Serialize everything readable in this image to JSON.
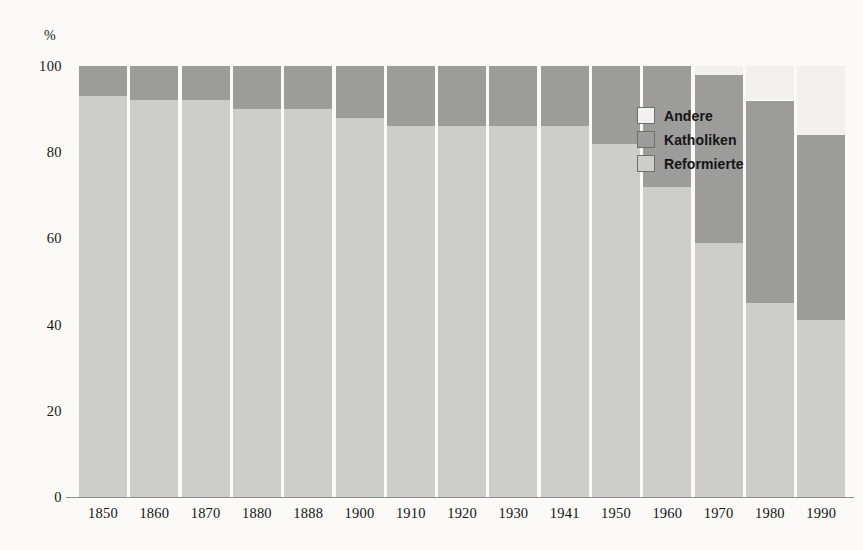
{
  "chart_data": {
    "type": "bar",
    "stacked": true,
    "title": "",
    "subtitle": "",
    "xlabel": "",
    "ylabel": "%",
    "ylim": [
      0,
      100
    ],
    "yticks": [
      "0",
      "20",
      "40",
      "60",
      "80",
      "100"
    ],
    "ytick_values": [
      0,
      20,
      40,
      60,
      80,
      100
    ],
    "grid": false,
    "legend_position": "inside-right",
    "categories": [
      "1850",
      "1860",
      "1870",
      "1880",
      "1888",
      "1900",
      "1910",
      "1920",
      "1930",
      "1941",
      "1950",
      "1960",
      "1970",
      "1980",
      "1990"
    ],
    "series": [
      {
        "name": "Reformierte",
        "color": "#cdcdcb",
        "values": [
          93,
          92,
          92,
          90,
          90,
          88,
          86,
          86,
          86,
          86,
          82,
          72,
          59,
          45,
          41
        ]
      },
      {
        "name": "Katholiken",
        "color": "#9c9c9a",
        "values": [
          7,
          8,
          8,
          10,
          10,
          12,
          14,
          14,
          14,
          14,
          18,
          28,
          39,
          47,
          43
        ]
      },
      {
        "name": "Andere",
        "color": "#f2f1ef",
        "values": [
          0,
          0,
          0,
          0,
          0,
          0,
          0,
          0,
          0,
          0,
          0,
          0,
          2,
          8,
          16
        ]
      }
    ]
  },
  "axis": {
    "unit_label": "%",
    "y_ticks": [
      {
        "label": "100",
        "value": 100
      },
      {
        "label": "80",
        "value": 80
      },
      {
        "label": "60",
        "value": 60
      },
      {
        "label": "40",
        "value": 40
      },
      {
        "label": "20",
        "value": 20
      },
      {
        "label": "0",
        "value": 0
      }
    ],
    "x_ticks": [
      "1850",
      "1860",
      "1870",
      "1880",
      "1888",
      "1900",
      "1910",
      "1920",
      "1930",
      "1941",
      "1950",
      "1960",
      "1970",
      "1980",
      "1990"
    ]
  },
  "legend": {
    "items": [
      {
        "label": "Andere",
        "color": "#f2f1ef"
      },
      {
        "label": "Katholiken",
        "color": "#9c9c9a"
      },
      {
        "label": "Reformierte",
        "color": "#cdcdcb"
      }
    ]
  },
  "colors": {
    "background": "#fbfaf7",
    "reformierte": "#cdcdcb",
    "katholiken": "#9c9c9a",
    "andere": "#f2f1ef",
    "text": "#141414",
    "baseline": "#8e8e8e"
  }
}
